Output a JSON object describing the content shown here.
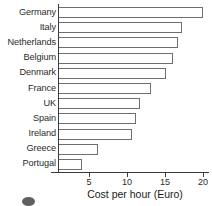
{
  "chart_data": {
    "type": "bar",
    "orientation": "horizontal",
    "title": "",
    "xlabel": "Cost per hour (Euro)",
    "ylabel": "",
    "categories": [
      "Germany",
      "Italy",
      "Netherlands",
      "Belgium",
      "Denmark",
      "France",
      "UK",
      "Spain",
      "Ireland",
      "Greece",
      "Portugal"
    ],
    "values": [
      20.0,
      17.3,
      16.7,
      16.0,
      15.1,
      13.2,
      11.7,
      11.2,
      10.6,
      6.2,
      4.1
    ],
    "xlim": [
      0,
      21
    ],
    "xticks": [
      5,
      10,
      15,
      20
    ],
    "xtick_labels": [
      "5",
      "10",
      "15",
      "20"
    ],
    "grid": false,
    "legend": false,
    "bar_fill_color": "#ffffff",
    "bar_edge_color": "#6e6e72",
    "axis_color": "#3a3a3a",
    "text_color": "#2b2b2b"
  }
}
